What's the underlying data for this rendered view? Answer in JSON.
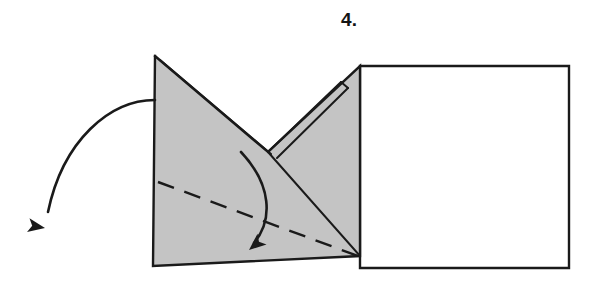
{
  "figure": {
    "kind": "origami-folding-instruction",
    "step_label": "4.",
    "canvas": {
      "width": 598,
      "height": 287
    },
    "colors": {
      "paper_shaded": "#c4c4c4",
      "paper_white": "#ffffff",
      "stroke": "#1a1a1a",
      "background": "#ffffff",
      "step_text": "#141414"
    },
    "strokes": {
      "outline_width": 2.4,
      "fold_line_width": 2.0,
      "crease_dash_width": 2.4,
      "crease_dash_pattern": "17 11",
      "arrow_width": 2.6
    },
    "shapes": {
      "white_panel": {
        "name": "right-white-panel",
        "points": "360,66 569,66 569,268 360,268",
        "description": "large unfolded white rectangle on the right"
      },
      "shaded_body": {
        "name": "shaded-folded-body",
        "points": "155,56 268,152 360,66 360,256 153,266",
        "description": "gray shaded folded paper with a V notch at the top"
      },
      "white_notch": {
        "name": "v-notch-white-region",
        "points": "155,56 268,152 360,66",
        "description": "white triangular V gap between the two raised flaps"
      }
    },
    "fold_lines": [
      {
        "name": "left-flap-inner-edge",
        "from": "160,60",
        "to": "271,154"
      },
      {
        "name": "right-flap-strip-outer",
        "from": "268,152",
        "to": "341,82"
      },
      {
        "name": "right-flap-strip-inner",
        "from": "277,158",
        "to": "348,88"
      },
      {
        "name": "right-flap-strip-cap",
        "from": "341,82",
        "to": "348,88"
      },
      {
        "name": "center-diagonal-to-corner",
        "from": "268,152",
        "to": "360,256"
      }
    ],
    "crease_line": {
      "name": "valley-crease-dashed",
      "from": "158,182",
      "to": "358,256",
      "style": "dashed"
    },
    "arrows": [
      {
        "name": "outer-unfold-arrow",
        "path": "M 155,100 C 110,100 63,140 48,212",
        "head_at": "45,228",
        "head_angle_deg": 100,
        "description": "curved arrow leaving the left edge, sweeping down and to the left"
      },
      {
        "name": "inner-fold-arrow",
        "path": "M 241,152 C 272,185 273,220 254,243",
        "head_at": "249,250",
        "head_angle_deg": 230,
        "description": "curved arrow inside the shaded body folding the flap down-left"
      }
    ]
  }
}
